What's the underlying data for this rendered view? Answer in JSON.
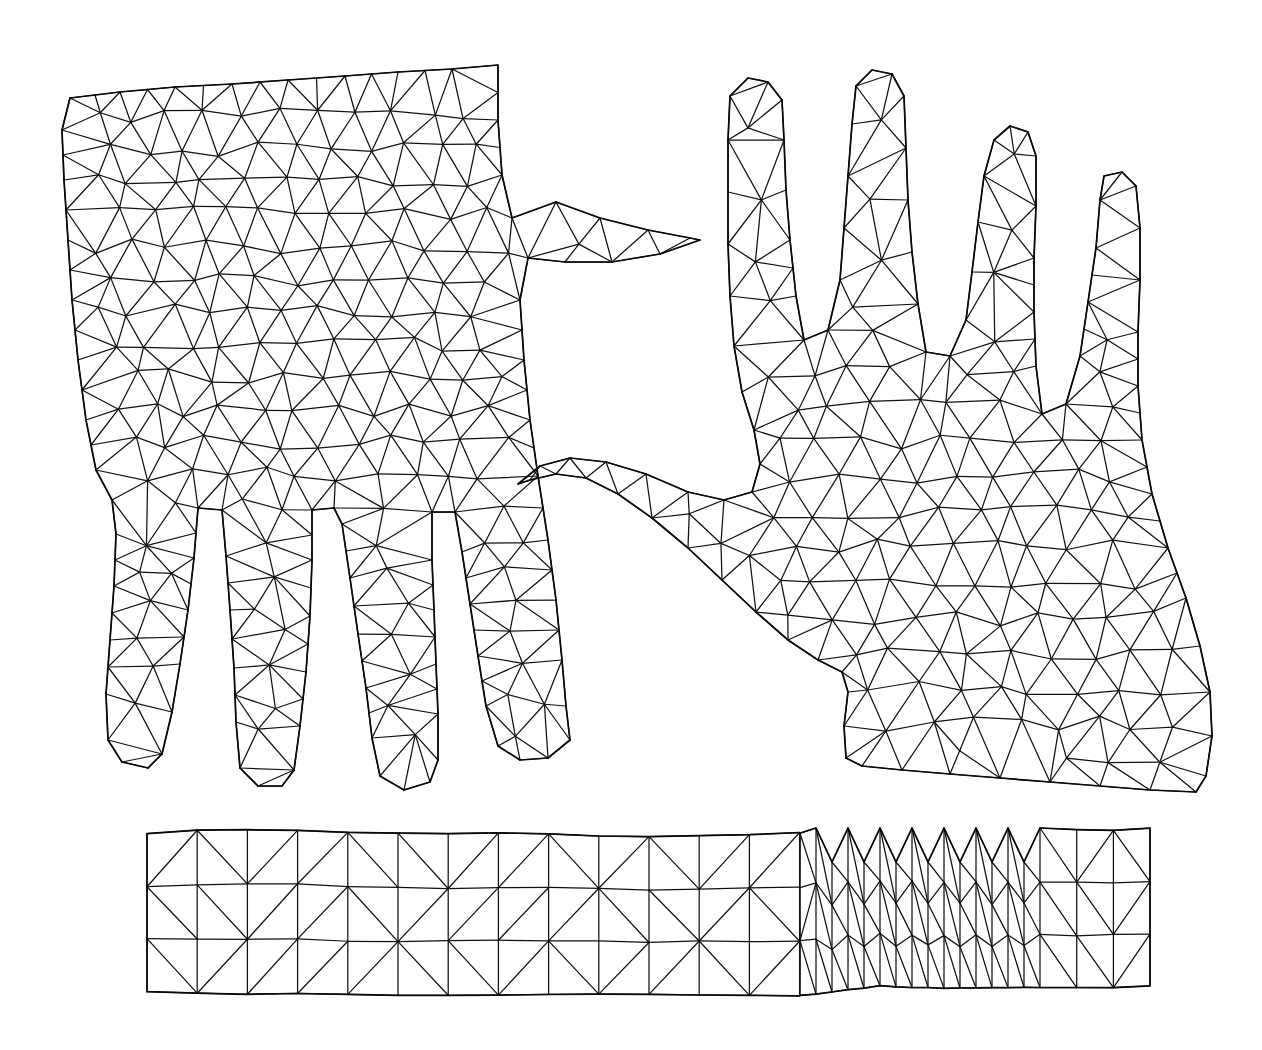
{
  "figure": {
    "background_color": "#ffffff",
    "line_color": "#111111",
    "outline_color": "#0a0a0a",
    "canvas": {
      "width": 1262,
      "height": 1050
    },
    "shape_count": 3,
    "shape_labels": [
      "left-hand-mesh",
      "right-hand-mesh",
      "strip-mesh"
    ]
  },
  "chart_data": {
    "type": "diagram",
    "xlabel": "",
    "ylabel": "",
    "grid": false,
    "legend": "none",
    "xlim": [
      0,
      1262
    ],
    "ylim": [
      0,
      1050
    ],
    "shapes": [
      {
        "name": "left-hand-mesh",
        "description": "Back-of-hand outline, fingers pointing down, thumb extending to the right, dense triangular mesh",
        "mesh_style": "unstructured-triangular",
        "approx_elements": 520,
        "approx_nodes": 290,
        "bbox": [
          62,
          78,
          700,
          800
        ],
        "outline": [
          [
            70,
            98
          ],
          [
            120,
            92
          ],
          [
            175,
            87
          ],
          [
            232,
            84
          ],
          [
            288,
            80
          ],
          [
            345,
            76
          ],
          [
            398,
            72
          ],
          [
            452,
            69
          ],
          [
            498,
            65
          ],
          [
            498,
            120
          ],
          [
            502,
            175
          ],
          [
            512,
            218
          ],
          [
            556,
            202
          ],
          [
            600,
            218
          ],
          [
            648,
            230
          ],
          [
            690,
            238
          ],
          [
            700,
            240
          ],
          [
            660,
            254
          ],
          [
            612,
            262
          ],
          [
            565,
            262
          ],
          [
            528,
            258
          ],
          [
            520,
            300
          ],
          [
            524,
            360
          ],
          [
            530,
            420
          ],
          [
            538,
            476
          ],
          [
            548,
            540
          ],
          [
            556,
            600
          ],
          [
            562,
            660
          ],
          [
            566,
            706
          ],
          [
            570,
            740
          ],
          [
            548,
            758
          ],
          [
            520,
            760
          ],
          [
            498,
            746
          ],
          [
            486,
            706
          ],
          [
            478,
            656
          ],
          [
            470,
            604
          ],
          [
            462,
            552
          ],
          [
            455,
            512
          ],
          [
            432,
            512
          ],
          [
            432,
            560
          ],
          [
            434,
            610
          ],
          [
            436,
            664
          ],
          [
            438,
            714
          ],
          [
            438,
            760
          ],
          [
            430,
            782
          ],
          [
            404,
            790
          ],
          [
            380,
            776
          ],
          [
            372,
            738
          ],
          [
            366,
            688
          ],
          [
            358,
            634
          ],
          [
            350,
            578
          ],
          [
            342,
            524
          ],
          [
            334,
            508
          ],
          [
            312,
            510
          ],
          [
            312,
            560
          ],
          [
            310,
            616
          ],
          [
            306,
            672
          ],
          [
            300,
            726
          ],
          [
            294,
            770
          ],
          [
            282,
            786
          ],
          [
            258,
            786
          ],
          [
            240,
            768
          ],
          [
            236,
            722
          ],
          [
            234,
            668
          ],
          [
            230,
            610
          ],
          [
            226,
            556
          ],
          [
            222,
            510
          ],
          [
            198,
            508
          ],
          [
            194,
            558
          ],
          [
            188,
            610
          ],
          [
            180,
            664
          ],
          [
            172,
            712
          ],
          [
            162,
            754
          ],
          [
            148,
            768
          ],
          [
            122,
            762
          ],
          [
            108,
            740
          ],
          [
            106,
            694
          ],
          [
            110,
            640
          ],
          [
            114,
            586
          ],
          [
            116,
            534
          ],
          [
            112,
            500
          ],
          [
            96,
            470
          ],
          [
            86,
            420
          ],
          [
            78,
            360
          ],
          [
            72,
            300
          ],
          [
            68,
            240
          ],
          [
            64,
            180
          ],
          [
            62,
            130
          ]
        ]
      },
      {
        "name": "right-hand-mesh",
        "description": "Palm outline, four fingers pointing up, thumb extending to the upper-left, dense triangular mesh",
        "mesh_style": "unstructured-triangular",
        "approx_elements": 560,
        "approx_nodes": 310,
        "bbox": [
          518,
          70,
          1215,
          800
        ],
        "outline": [
          [
            730,
            96
          ],
          [
            748,
            78
          ],
          [
            768,
            82
          ],
          [
            782,
            100
          ],
          [
            784,
            140
          ],
          [
            786,
            190
          ],
          [
            790,
            240
          ],
          [
            796,
            296
          ],
          [
            804,
            340
          ],
          [
            828,
            330
          ],
          [
            840,
            280
          ],
          [
            844,
            228
          ],
          [
            848,
            176
          ],
          [
            852,
            124
          ],
          [
            856,
            86
          ],
          [
            872,
            70
          ],
          [
            892,
            74
          ],
          [
            904,
            96
          ],
          [
            906,
            148
          ],
          [
            908,
            200
          ],
          [
            912,
            252
          ],
          [
            918,
            304
          ],
          [
            926,
            352
          ],
          [
            950,
            356
          ],
          [
            966,
            320
          ],
          [
            972,
            272
          ],
          [
            978,
            222
          ],
          [
            984,
            176
          ],
          [
            994,
            140
          ],
          [
            1010,
            126
          ],
          [
            1028,
            132
          ],
          [
            1036,
            156
          ],
          [
            1036,
            206
          ],
          [
            1034,
            258
          ],
          [
            1034,
            312
          ],
          [
            1036,
            366
          ],
          [
            1042,
            414
          ],
          [
            1066,
            404
          ],
          [
            1080,
            356
          ],
          [
            1088,
            302
          ],
          [
            1096,
            248
          ],
          [
            1100,
            200
          ],
          [
            1104,
            176
          ],
          [
            1122,
            172
          ],
          [
            1136,
            186
          ],
          [
            1140,
            228
          ],
          [
            1140,
            280
          ],
          [
            1138,
            332
          ],
          [
            1138,
            386
          ],
          [
            1142,
            440
          ],
          [
            1152,
            494
          ],
          [
            1168,
            548
          ],
          [
            1186,
            598
          ],
          [
            1200,
            646
          ],
          [
            1210,
            692
          ],
          [
            1212,
            736
          ],
          [
            1206,
            776
          ],
          [
            1196,
            792
          ],
          [
            1150,
            790
          ],
          [
            1100,
            786
          ],
          [
            1050,
            782
          ],
          [
            1000,
            778
          ],
          [
            950,
            774
          ],
          [
            902,
            770
          ],
          [
            862,
            766
          ],
          [
            846,
            758
          ],
          [
            844,
            726
          ],
          [
            848,
            692
          ],
          [
            842,
            672
          ],
          [
            818,
            660
          ],
          [
            788,
            640
          ],
          [
            756,
            612
          ],
          [
            722,
            580
          ],
          [
            688,
            548
          ],
          [
            652,
            518
          ],
          [
            618,
            494
          ],
          [
            586,
            478
          ],
          [
            556,
            474
          ],
          [
            530,
            480
          ],
          [
            518,
            484
          ],
          [
            540,
            466
          ],
          [
            570,
            458
          ],
          [
            606,
            462
          ],
          [
            646,
            474
          ],
          [
            688,
            492
          ],
          [
            724,
            500
          ],
          [
            752,
            492
          ],
          [
            760,
            464
          ],
          [
            754,
            430
          ],
          [
            742,
            392
          ],
          [
            734,
            346
          ],
          [
            730,
            296
          ],
          [
            728,
            244
          ],
          [
            728,
            192
          ],
          [
            728,
            140
          ]
        ]
      },
      {
        "name": "strip-mesh",
        "description": "Long horizontal band of triangular elements, three rows tall, with a stepped notch and zig-zag refinement near the right-centre",
        "mesh_style": "structured-triangular-band",
        "rows": 3,
        "approx_elements": 150,
        "approx_nodes": 110,
        "bbox": [
          147,
          828,
          1150,
          996
        ],
        "top_edge": [
          [
            147,
            834
          ],
          [
            200,
            830
          ],
          [
            262,
            830
          ],
          [
            330,
            832
          ],
          [
            400,
            833
          ],
          [
            468,
            833
          ],
          [
            540,
            834
          ],
          [
            612,
            836
          ],
          [
            682,
            836
          ],
          [
            752,
            834
          ],
          [
            800,
            833
          ],
          [
            806,
            860
          ],
          [
            848,
            828
          ],
          [
            880,
            862
          ],
          [
            912,
            828
          ],
          [
            944,
            862
          ],
          [
            976,
            828
          ],
          [
            1008,
            862
          ],
          [
            1040,
            828
          ],
          [
            1070,
            830
          ],
          [
            1110,
            830
          ],
          [
            1150,
            828
          ]
        ],
        "bottom_edge": [
          [
            147,
            992
          ],
          [
            200,
            993
          ],
          [
            262,
            994
          ],
          [
            330,
            994
          ],
          [
            400,
            995
          ],
          [
            468,
            995
          ],
          [
            540,
            994
          ],
          [
            612,
            994
          ],
          [
            682,
            995
          ],
          [
            752,
            996
          ],
          [
            806,
            996
          ],
          [
            848,
            990
          ],
          [
            880,
            986
          ],
          [
            912,
            988
          ],
          [
            944,
            988
          ],
          [
            976,
            988
          ],
          [
            1008,
            988
          ],
          [
            1040,
            988
          ],
          [
            1070,
            988
          ],
          [
            1110,
            988
          ],
          [
            1150,
            986
          ]
        ]
      }
    ]
  }
}
